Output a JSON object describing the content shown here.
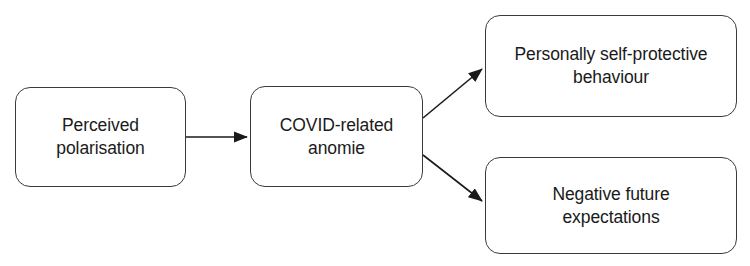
{
  "diagram": {
    "type": "flow-diagram",
    "background_color": "#ffffff",
    "box_border_color": "#3b3b3b",
    "text_color": "#1a1a1a",
    "arrow_color": "#1a1a1a",
    "nodes": [
      {
        "id": "perceived-polarisation",
        "label": "Perceived\npolarisation",
        "x": 15,
        "y": 87,
        "width": 171,
        "height": 100
      },
      {
        "id": "covid-anomie",
        "label": "COVID-related\nanomie",
        "x": 250,
        "y": 86,
        "width": 173,
        "height": 101
      },
      {
        "id": "self-protective",
        "label": "Personally self-protective\nbehaviour",
        "x": 485,
        "y": 15,
        "width": 252,
        "height": 102
      },
      {
        "id": "negative-expectations",
        "label": "Negative future\nexpectations",
        "x": 485,
        "y": 157,
        "width": 252,
        "height": 97
      }
    ],
    "edges": [
      {
        "id": "polarisation-to-anomie",
        "from": "perceived-polarisation",
        "to": "covid-anomie",
        "x1": 186,
        "y1": 137,
        "x2": 249,
        "y2": 137
      },
      {
        "id": "anomie-to-self-protective",
        "from": "covid-anomie",
        "to": "self-protective",
        "x1": 423,
        "y1": 118,
        "x2": 484,
        "y2": 67
      },
      {
        "id": "anomie-to-negative-expectations",
        "from": "covid-anomie",
        "to": "negative-expectations",
        "x1": 423,
        "y1": 155,
        "x2": 484,
        "y2": 203
      }
    ]
  }
}
